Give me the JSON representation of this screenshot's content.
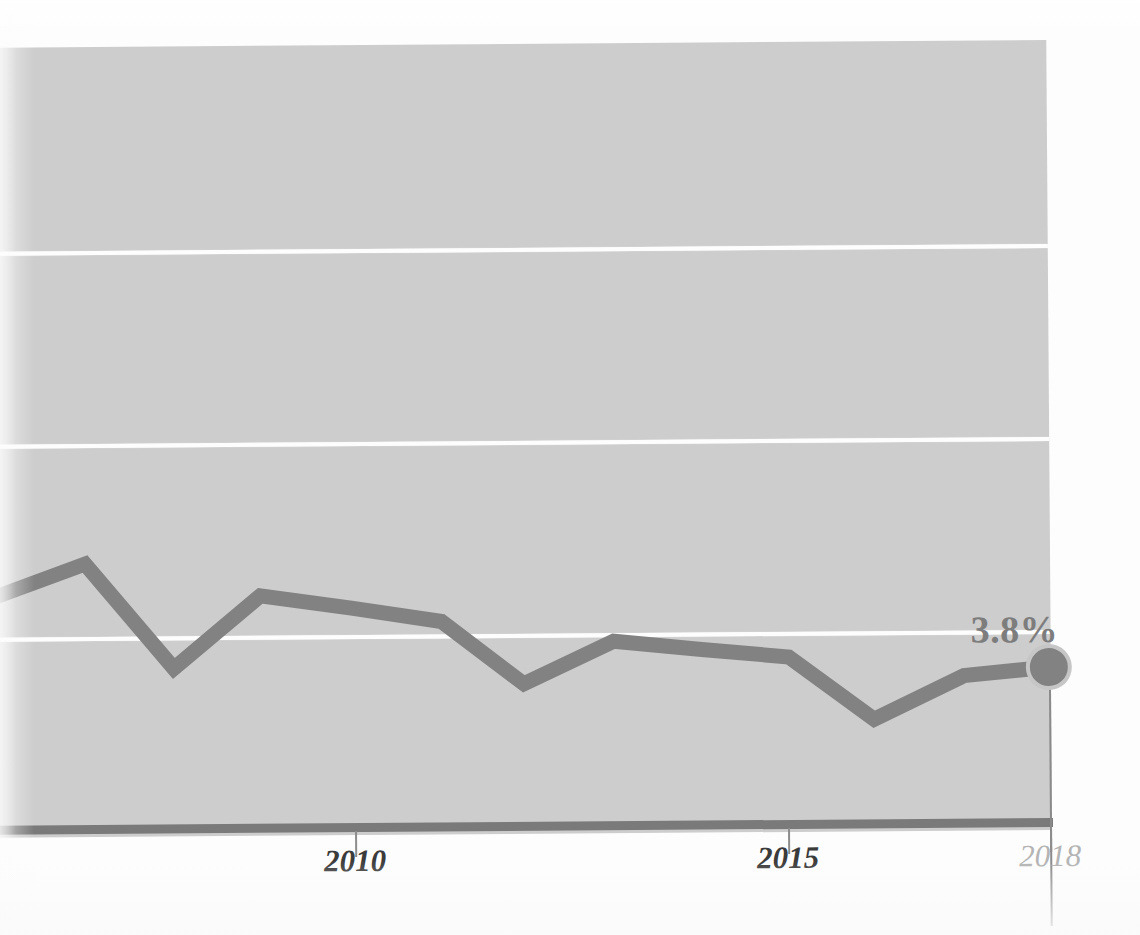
{
  "figure": {
    "kind": "line-chart",
    "scan_rotation_deg": -0.42,
    "value_label": "3.8%"
  },
  "colors": {
    "page_background": "#fdfdfd",
    "plot_background": "#cdcdcd",
    "gridline": "#fdfdfd",
    "series_line": "#828282",
    "axis_line": "#7a7a7a",
    "tick_label": "#3b3b3b",
    "tick_label_muted": "#b4b4b4",
    "value_label": "#7d7d7d"
  },
  "axis": {
    "x_ticks": [
      {
        "label": "2010",
        "x": 355,
        "muted": false
      },
      {
        "label": "2015",
        "x": 788,
        "muted": false
      },
      {
        "label": "2018",
        "x": 1050,
        "muted": true
      }
    ],
    "gridlines_y": [
      244,
      437,
      630
    ]
  },
  "chart_data": {
    "type": "line",
    "title": "",
    "subtitle": "",
    "xlabel": "",
    "ylabel": "",
    "grid": true,
    "legend": "none",
    "xlim": [
      2004,
      2018
    ],
    "ylim": [
      0,
      11
    ],
    "x": [
      2004,
      2005,
      2006,
      2007,
      2008,
      2009,
      2010,
      2011,
      2012,
      2013,
      2014,
      2015,
      2016,
      2017,
      2018
    ],
    "series": [
      {
        "name": "Unemployment rate",
        "values": [
          5.5,
          5.1,
          4.6,
          4.6,
          5.8,
          9.3,
          9.6,
          8.9,
          8.1,
          7.4,
          6.2,
          5.3,
          4.9,
          4.4,
          3.8
        ],
        "color": "#828282",
        "end_label": "3.8%",
        "end_marker": "circle"
      }
    ],
    "pixel_polyline": [
      {
        "x": -2,
        "y": 589
      },
      {
        "x": 87,
        "y": 557
      },
      {
        "x": 175,
        "y": 662
      },
      {
        "x": 262,
        "y": 590
      },
      {
        "x": 353,
        "y": 603
      },
      {
        "x": 443,
        "y": 617
      },
      {
        "x": 525,
        "y": 680
      },
      {
        "x": 615,
        "y": 638
      },
      {
        "x": 703,
        "y": 647
      },
      {
        "x": 790,
        "y": 655
      },
      {
        "x": 875,
        "y": 718
      },
      {
        "x": 965,
        "y": 675
      },
      {
        "x": 1050,
        "y": 667
      }
    ],
    "annotations": [
      {
        "text": "3.8%",
        "x": 1050,
        "y": 667,
        "placement": "above-left"
      }
    ]
  }
}
